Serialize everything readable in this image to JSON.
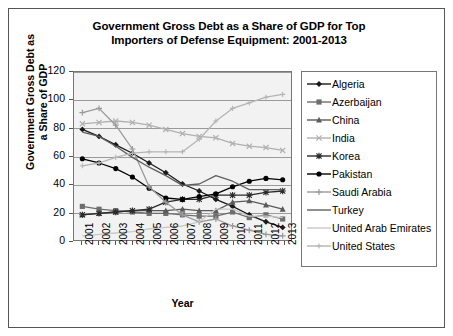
{
  "chart_data": {
    "type": "line",
    "title": "Government Gross Debt as a Share of GDP for Top Importers of Defense Equipment: 2001-2013",
    "title_line1": "Government Gross Debt as a Share of GDP for Top",
    "title_line2": "Importers of Defense Equipment: 2001-2013",
    "xlabel": "Year",
    "ylabel": "Government Gross Debt as a Share of GDP",
    "ylabel_line1": "Government Gross Debt as",
    "ylabel_line2": "a Share of GDP",
    "ylim": [
      0,
      120
    ],
    "yticks": [
      0,
      20,
      40,
      60,
      80,
      100,
      120
    ],
    "grid": true,
    "legend_position": "right",
    "categories": [
      "2001",
      "2002",
      "2003",
      "2004",
      "2005",
      "2006",
      "2007",
      "2008",
      "2009",
      "2010",
      "2011",
      "2012",
      "2013"
    ],
    "x": [
      "2001",
      "2002",
      "2003",
      "2004",
      "2005",
      "2006",
      "2007",
      "2008",
      "2009",
      "2010",
      "2011",
      "2012",
      "2013"
    ],
    "series": [
      {
        "name": "Algeria",
        "marker": "diamond",
        "color": "#1a1a1a",
        "values": [
          79,
          74,
          68,
          62,
          55,
          48,
          40,
          35,
          29,
          24,
          18,
          13,
          9
        ]
      },
      {
        "name": "Azerbaijan",
        "marker": "square",
        "color": "#6e6e6e",
        "values": [
          24,
          22,
          21,
          20,
          19,
          19,
          18,
          17,
          17,
          20,
          16,
          18,
          15
        ]
      },
      {
        "name": "China",
        "marker": "triangle",
        "color": "#5a5a5a",
        "values": [
          18,
          19,
          20,
          21,
          21,
          21,
          22,
          21,
          21,
          27,
          28,
          25,
          22
        ]
      },
      {
        "name": "India",
        "marker": "x",
        "color": "#b0b0b0",
        "values": [
          83,
          84,
          85,
          84,
          82,
          79,
          76,
          74,
          73,
          69,
          67,
          66,
          64
        ]
      },
      {
        "name": "Korea",
        "marker": "star",
        "color": "#2b2b2b",
        "values": [
          18,
          19,
          20,
          21,
          22,
          27,
          29,
          29,
          32,
          32,
          32,
          34,
          35
        ]
      },
      {
        "name": "Pakistan",
        "marker": "circle",
        "color": "#000000",
        "values": [
          58,
          55,
          51,
          45,
          37,
          30,
          29,
          31,
          33,
          38,
          42,
          44,
          43
        ]
      },
      {
        "name": "Saudi Arabia",
        "marker": "plus",
        "color": "#9a9a9a",
        "values": [
          91,
          94,
          82,
          65,
          38,
          27,
          18,
          13,
          15,
          10,
          7,
          4,
          3
        ]
      },
      {
        "name": "Turkey",
        "marker": "none",
        "color": "#5f5f5f",
        "values": [
          77,
          74,
          67,
          59,
          52,
          46,
          39,
          40,
          46,
          42,
          36,
          36,
          36
        ]
      },
      {
        "name": "United Arab Emirates",
        "marker": "none",
        "color": "#c8c8c8",
        "values": [
          3,
          4,
          5,
          6,
          8,
          9,
          10,
          13,
          22,
          22,
          17,
          17,
          16
        ]
      },
      {
        "name": "United States",
        "marker": "plus-small",
        "color": "#b5b5b5",
        "values": [
          53,
          55,
          59,
          62,
          63,
          63,
          63,
          72,
          85,
          94,
          98,
          102,
          104
        ]
      }
    ]
  },
  "legend": {
    "items": [
      {
        "label": "Algeria"
      },
      {
        "label": "Azerbaijan"
      },
      {
        "label": "China"
      },
      {
        "label": "India"
      },
      {
        "label": "Korea"
      },
      {
        "label": "Pakistan"
      },
      {
        "label": "Saudi Arabia"
      },
      {
        "label": "Turkey"
      },
      {
        "label": "United Arab Emirates"
      },
      {
        "label": "United States"
      }
    ]
  }
}
